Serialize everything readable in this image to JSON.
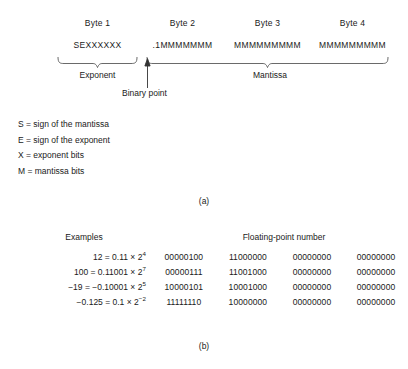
{
  "figure_a": {
    "byte_headers": [
      "Byte 1",
      "Byte 2",
      "Byte 3",
      "Byte 4"
    ],
    "byte_fields": [
      "SEXXXXXX",
      ".1MMMMMMM",
      "MMMMMMMMM",
      "MMMMMMMMM"
    ],
    "exponent_label": "Exponent",
    "mantissa_label": "Mantissa",
    "binary_point_label": "Binary point",
    "caption": "(a)"
  },
  "legend": {
    "items": [
      "S = sign of the mantissa",
      "E = sign of the exponent",
      "X = exponent bits",
      "M = mantissa bits"
    ]
  },
  "figure_b": {
    "headers": {
      "examples": "Examples",
      "floating_point_number": "Floating-point number"
    },
    "rows": [
      {
        "value": "12",
        "equals": "=",
        "mantissa": "0.11",
        "times": "×",
        "base": "2",
        "exponent": "4",
        "bytes": [
          "00000100",
          "11000000",
          "00000000",
          "00000000"
        ]
      },
      {
        "value": "100",
        "equals": "=",
        "mantissa": "0.11001",
        "times": "×",
        "base": "2",
        "exponent": "7",
        "bytes": [
          "00000111",
          "11001000",
          "00000000",
          "00000000"
        ]
      },
      {
        "value": "−19",
        "equals": "=",
        "mantissa": "−0.10001",
        "times": "×",
        "base": "2",
        "exponent": "5",
        "bytes": [
          "10000101",
          "10001000",
          "00000000",
          "00000000"
        ]
      },
      {
        "value": "−0.125",
        "equals": "=",
        "mantissa": "0.1",
        "times": "×",
        "base": "2",
        "exponent": "−2",
        "bytes": [
          "11111110",
          "10000000",
          "00000000",
          "00000000"
        ]
      }
    ],
    "caption": "(b)"
  },
  "colors": {
    "ink": "#1a1a1a",
    "rule": "#555555",
    "background": "#ffffff"
  }
}
